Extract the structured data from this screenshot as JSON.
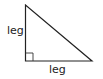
{
  "diagram": {
    "type": "right-triangle",
    "labels": {
      "vertical_leg": "leg",
      "horizontal_leg": "leg"
    },
    "colors": {
      "stroke": "#222222",
      "background": "#ffffff"
    }
  }
}
